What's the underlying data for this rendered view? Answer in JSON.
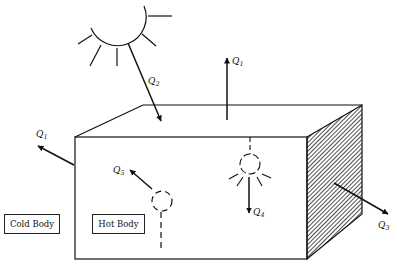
{
  "diagram": {
    "title": "",
    "labels": {
      "cold_body": "Cold Body",
      "hot_body": "Hot Body"
    },
    "heat_flows": [
      {
        "id": "Q1_top",
        "symbol": "Q",
        "subscript": "1",
        "description": "heat leaving top surface upward"
      },
      {
        "id": "Q1_left",
        "symbol": "Q",
        "subscript": "1",
        "description": "heat leaving left side toward cold body"
      },
      {
        "id": "Q2",
        "symbol": "Q",
        "subscript": "2",
        "description": "solar radiation entering top"
      },
      {
        "id": "Q3",
        "symbol": "Q",
        "subscript": "3",
        "description": "heat leaving shaded right face"
      },
      {
        "id": "Q4",
        "symbol": "Q",
        "subscript": "4",
        "description": "heat from internal lamp"
      },
      {
        "id": "Q5",
        "symbol": "Q",
        "subscript": "5",
        "description": "heat from internal source"
      }
    ],
    "elements": [
      "sun",
      "box",
      "shaded-right-face",
      "lamp",
      "internal-source"
    ],
    "colors": {
      "line": "#111111",
      "background": "#ffffff"
    }
  }
}
